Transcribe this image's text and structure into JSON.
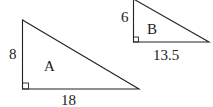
{
  "diagram": {
    "triangles": [
      {
        "name": "A",
        "label": "A",
        "height_label": "8",
        "base_label": "18"
      },
      {
        "name": "B",
        "label": "B",
        "height_label": "6",
        "base_label": "13.5"
      }
    ],
    "colors": {
      "stroke": "#222222",
      "background": "#ffffff"
    }
  }
}
